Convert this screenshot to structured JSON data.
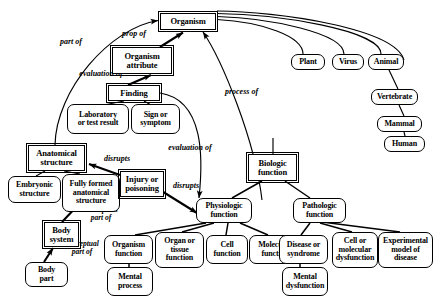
{
  "diagram": {
    "style": {
      "line_color": "#000000",
      "background": "#ffffff",
      "text_color": "#000000"
    },
    "nodes": [
      {
        "id": "organism",
        "label": "Organism",
        "shape": "rect",
        "x": 160,
        "y": 13,
        "w": 56,
        "h": 17,
        "fs": 8.5
      },
      {
        "id": "organism_attribute",
        "label": "Organism\nattribute",
        "shape": "rect",
        "x": 112,
        "y": 47,
        "w": 60,
        "h": 27,
        "fs": 8.5
      },
      {
        "id": "finding",
        "label": "Finding",
        "shape": "rect",
        "x": 108,
        "y": 85,
        "w": 52,
        "h": 16,
        "fs": 8.5
      },
      {
        "id": "laboratory_result",
        "label": "Laboratory\nor test result",
        "shape": "round",
        "x": 67,
        "y": 104,
        "w": 62,
        "h": 30,
        "fs": 8
      },
      {
        "id": "sign_or_symptom",
        "label": "Sign or\nsymptom",
        "shape": "round",
        "x": 131,
        "y": 104,
        "w": 49,
        "h": 30,
        "fs": 8
      },
      {
        "id": "plant",
        "label": "Plant",
        "shape": "round",
        "x": 291,
        "y": 54,
        "w": 34,
        "h": 16,
        "fs": 8
      },
      {
        "id": "virus",
        "label": "Virus",
        "shape": "round",
        "x": 332,
        "y": 54,
        "w": 32,
        "h": 16,
        "fs": 8
      },
      {
        "id": "animal",
        "label": "Animal",
        "shape": "round",
        "x": 368,
        "y": 54,
        "w": 36,
        "h": 16,
        "fs": 8
      },
      {
        "id": "vertebrate",
        "label": "Vertebrate",
        "shape": "round",
        "x": 371,
        "y": 89,
        "w": 47,
        "h": 16,
        "fs": 8
      },
      {
        "id": "mammal",
        "label": "Mammal",
        "shape": "round",
        "x": 377,
        "y": 116,
        "w": 45,
        "h": 16,
        "fs": 8
      },
      {
        "id": "human",
        "label": "Human",
        "shape": "round",
        "x": 384,
        "y": 136,
        "w": 41,
        "h": 16,
        "fs": 8
      },
      {
        "id": "anatomical_structure",
        "label": "Anatomical\nstructure",
        "shape": "rect",
        "x": 28,
        "y": 145,
        "w": 57,
        "h": 26,
        "fs": 8.5
      },
      {
        "id": "embryonic_structure",
        "label": "Embryonic\nstructure",
        "shape": "round",
        "x": 8,
        "y": 176,
        "w": 53,
        "h": 27,
        "fs": 8
      },
      {
        "id": "fully_formed",
        "label": "Fully formed\nanatomical\nstructure",
        "shape": "round",
        "x": 62,
        "y": 174,
        "w": 58,
        "h": 38,
        "fs": 8
      },
      {
        "id": "injury_poisoning",
        "label": "Injury or\npoisoning",
        "shape": "rect",
        "x": 120,
        "y": 171,
        "w": 44,
        "h": 26,
        "fs": 8.5
      },
      {
        "id": "body_system",
        "label": "Body\nsystem",
        "shape": "rect",
        "x": 44,
        "y": 222,
        "w": 35,
        "h": 25,
        "fs": 8.5
      },
      {
        "id": "body_part",
        "label": "Body\npart",
        "shape": "round",
        "x": 25,
        "y": 262,
        "w": 43,
        "h": 25,
        "fs": 8
      },
      {
        "id": "biologic_function",
        "label": "Biologic\nfunction",
        "shape": "rect",
        "x": 248,
        "y": 154,
        "w": 49,
        "h": 27,
        "fs": 8.5
      },
      {
        "id": "physiologic_function",
        "label": "Physiologic\nfunction",
        "shape": "round",
        "x": 196,
        "y": 198,
        "w": 56,
        "h": 25,
        "fs": 8
      },
      {
        "id": "pathologic_function",
        "label": "Pathologic\nfunction",
        "shape": "round",
        "x": 293,
        "y": 198,
        "w": 53,
        "h": 25,
        "fs": 8
      },
      {
        "id": "organism_function",
        "label": "Organism\nfunction",
        "shape": "round",
        "x": 104,
        "y": 235,
        "w": 49,
        "h": 29,
        "fs": 8
      },
      {
        "id": "organ_tissue_function",
        "label": "Organ or\ntissue\nfunction",
        "shape": "round",
        "x": 155,
        "y": 232,
        "w": 49,
        "h": 36,
        "fs": 8
      },
      {
        "id": "cell_function",
        "label": "Cell\nfunction",
        "shape": "round",
        "x": 206,
        "y": 235,
        "w": 42,
        "h": 29,
        "fs": 8
      },
      {
        "id": "molecular_function",
        "label": "Molecular\nfunction",
        "shape": "round",
        "x": 249,
        "y": 235,
        "w": 52,
        "h": 29,
        "fs": 8
      },
      {
        "id": "mental_process",
        "label": "Mental\nprocess",
        "shape": "round",
        "x": 107,
        "y": 267,
        "w": 46,
        "h": 29,
        "fs": 8
      },
      {
        "id": "disease_or_syndrome",
        "label": "Disease or\nsyndrome",
        "shape": "round",
        "x": 279,
        "y": 235,
        "w": 49,
        "h": 29,
        "fs": 8
      },
      {
        "id": "mental_dysfunction",
        "label": "Mental\ndysfunction",
        "shape": "round",
        "x": 282,
        "y": 267,
        "w": 46,
        "h": 29,
        "fs": 8
      },
      {
        "id": "cell_molecular_dys",
        "label": "Cell or\nmolecular\ndysfunction",
        "shape": "round",
        "x": 332,
        "y": 232,
        "w": 46,
        "h": 36,
        "fs": 8
      },
      {
        "id": "experimental_model",
        "label": "Experimental\nmodel of\ndisease",
        "shape": "round",
        "x": 378,
        "y": 232,
        "w": 55,
        "h": 36,
        "fs": 8
      }
    ],
    "edge_labels": [
      {
        "id": "part_of",
        "text": "part of",
        "x": 53,
        "y": 38,
        "w": 36,
        "fs": 8
      },
      {
        "id": "prop_of",
        "text": "prop of",
        "x": 116,
        "y": 30,
        "w": 36,
        "fs": 8
      },
      {
        "id": "evaluation_of_1",
        "text": "evaluation of",
        "x": 72,
        "y": 70,
        "w": 58,
        "fs": 8
      },
      {
        "id": "process_of",
        "text": "process of",
        "x": 218,
        "y": 88,
        "w": 47,
        "fs": 8
      },
      {
        "id": "evaluation_of_2",
        "text": "evaluation of",
        "x": 161,
        "y": 144,
        "w": 58,
        "fs": 8
      },
      {
        "id": "disrupts_1",
        "text": "disrupts",
        "x": 97,
        "y": 155,
        "w": 40,
        "fs": 8
      },
      {
        "id": "disrupts_2",
        "text": "disrupts",
        "x": 166,
        "y": 182,
        "w": 40,
        "fs": 8
      },
      {
        "id": "conceptual_part_of_1",
        "text": "conceptual\npart of",
        "x": 74,
        "y": 206,
        "w": 54,
        "fs": 7.5
      },
      {
        "id": "conceptual_part_of_2",
        "text": "conceptual\npart of",
        "x": 55,
        "y": 240,
        "w": 54,
        "fs": 7.5
      }
    ]
  }
}
